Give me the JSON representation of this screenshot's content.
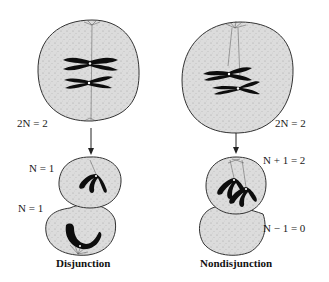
{
  "diagram": {
    "type": "meiosis-comparison",
    "colors": {
      "cell_fill": "#d9d9d9",
      "cell_outline": "#333333",
      "chromosome": "#0d0d0d",
      "spindle": "#555555",
      "text": "#1a1a1a",
      "background": "#ffffff"
    },
    "left_panel": {
      "title": "Disjunction",
      "parent_cell_label": "2N = 2",
      "daughter_top_label": "N = 1",
      "daughter_bottom_label": "N = 1"
    },
    "right_panel": {
      "title": "Nondisjunction",
      "parent_cell_label": "2N = 2",
      "daughter_top_label": "N + 1 = 2",
      "daughter_bottom_label": "N − 1 = 0"
    }
  }
}
